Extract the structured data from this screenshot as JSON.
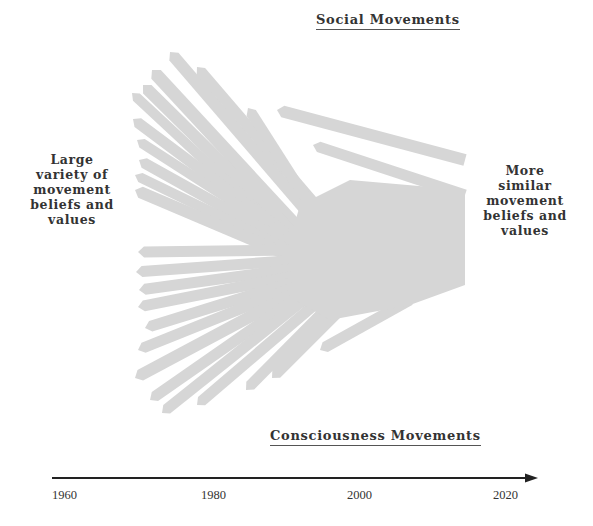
{
  "diagram": {
    "top_heading": "Social Movements",
    "bottom_heading": "Consciousness Movements",
    "left_label": [
      "Large",
      "variety of",
      "movement",
      "beliefs and",
      "values"
    ],
    "right_label": [
      "More",
      "similar",
      "movement",
      "beliefs and",
      "values"
    ],
    "strand_color": "#d6d6d6",
    "text_color": "#333333",
    "axis_color": "#222222"
  },
  "timeline": {
    "ticks": [
      {
        "label": "1960",
        "x": 52
      },
      {
        "label": "1980",
        "x": 201
      },
      {
        "label": "2000",
        "x": 347
      },
      {
        "label": "2020",
        "x": 493
      }
    ],
    "axis": {
      "x1": 52,
      "x2": 538,
      "y": 478
    }
  },
  "strands": [
    {
      "from": [
        170,
        52
      ],
      "to": [
        310,
        215
      ],
      "w": 12
    },
    {
      "from": [
        197,
        67
      ],
      "to": [
        320,
        210
      ],
      "w": 11
    },
    {
      "from": [
        152,
        70
      ],
      "to": [
        300,
        230
      ],
      "w": 13
    },
    {
      "from": [
        143,
        85
      ],
      "to": [
        295,
        235
      ],
      "w": 12
    },
    {
      "from": [
        132,
        93
      ],
      "to": [
        290,
        240
      ],
      "w": 10
    },
    {
      "from": [
        133,
        119
      ],
      "to": [
        295,
        240
      ],
      "w": 11
    },
    {
      "from": [
        137,
        140
      ],
      "to": [
        300,
        245
      ],
      "w": 10
    },
    {
      "from": [
        139,
        160
      ],
      "to": [
        300,
        250
      ],
      "w": 11
    },
    {
      "from": [
        135,
        175
      ],
      "to": [
        300,
        255
      ],
      "w": 10
    },
    {
      "from": [
        135,
        190
      ],
      "to": [
        300,
        260
      ],
      "w": 12
    },
    {
      "from": [
        248,
        108
      ],
      "to": [
        310,
        205
      ],
      "w": 11
    },
    {
      "from": [
        277,
        110
      ],
      "to": [
        465,
        160
      ],
      "w": 12
    },
    {
      "from": [
        313,
        145
      ],
      "to": [
        465,
        195
      ],
      "w": 11
    },
    {
      "from": [
        138,
        252
      ],
      "to": [
        300,
        250
      ],
      "w": 11
    },
    {
      "from": [
        136,
        272
      ],
      "to": [
        300,
        260
      ],
      "w": 11
    },
    {
      "from": [
        139,
        290
      ],
      "to": [
        300,
        268
      ],
      "w": 11
    },
    {
      "from": [
        138,
        307
      ],
      "to": [
        300,
        275
      ],
      "w": 11
    },
    {
      "from": [
        145,
        328
      ],
      "to": [
        300,
        280
      ],
      "w": 11
    },
    {
      "from": [
        138,
        350
      ],
      "to": [
        300,
        285
      ],
      "w": 11
    },
    {
      "from": [
        135,
        378
      ],
      "to": [
        300,
        290
      ],
      "w": 12
    },
    {
      "from": [
        150,
        400
      ],
      "to": [
        305,
        292
      ],
      "w": 11
    },
    {
      "from": [
        162,
        413
      ],
      "to": [
        310,
        295
      ],
      "w": 11
    },
    {
      "from": [
        197,
        405
      ],
      "to": [
        320,
        300
      ],
      "w": 11
    },
    {
      "from": [
        246,
        390
      ],
      "to": [
        330,
        305
      ],
      "w": 11
    },
    {
      "from": [
        272,
        378
      ],
      "to": [
        345,
        305
      ],
      "w": 11
    },
    {
      "from": [
        320,
        350
      ],
      "to": [
        410,
        300
      ],
      "w": 11
    }
  ],
  "core": {
    "points": [
      [
        300,
        205
      ],
      [
        350,
        180
      ],
      [
        465,
        190
      ],
      [
        465,
        285
      ],
      [
        410,
        305
      ],
      [
        330,
        320
      ],
      [
        295,
        300
      ],
      [
        290,
        240
      ]
    ]
  }
}
